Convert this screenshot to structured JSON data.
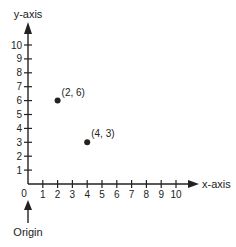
{
  "chart_data": {
    "type": "scatter",
    "title": "",
    "xlabel": "x-axis",
    "ylabel": "y-axis",
    "xlim": [
      0,
      10
    ],
    "ylim": [
      0,
      10
    ],
    "x_ticks": [
      1,
      2,
      3,
      4,
      5,
      6,
      7,
      8,
      9,
      10
    ],
    "y_ticks": [
      1,
      2,
      3,
      4,
      5,
      6,
      7,
      8,
      9,
      10
    ],
    "origin_label": "0",
    "annotation": "Origin",
    "grid": false,
    "points": [
      {
        "x": 2,
        "y": 6,
        "label": "(2, 6)"
      },
      {
        "x": 4,
        "y": 3,
        "label": "(4, 3)"
      }
    ]
  },
  "colors": {
    "axis": "#222222",
    "point": "#222222"
  }
}
